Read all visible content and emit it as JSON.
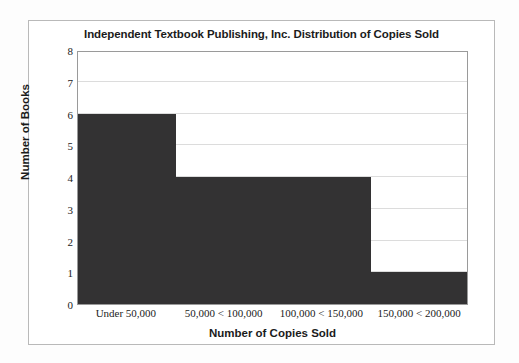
{
  "figure": {
    "background_color": "#ffffff",
    "frame_color": "#b9b9b9",
    "plot_border_color": "#9a9a9a"
  },
  "chart_data": {
    "type": "bar",
    "title": "Independent Textbook Publishing, Inc. Distribution of Copies Sold",
    "xlabel": "Number of Copies Sold",
    "ylabel": "Number of Books",
    "categories": [
      "Under 50,000",
      "50,000 < 100,000",
      "100,000 < 150,000",
      "150,000 < 200,000"
    ],
    "values": [
      6,
      4,
      4,
      1
    ],
    "ylim": [
      0,
      8
    ],
    "ytick_labels": [
      "0",
      "1",
      "2",
      "3",
      "4",
      "5",
      "6",
      "7",
      "8"
    ],
    "ytick_values": [
      0,
      1,
      2,
      3,
      4,
      5,
      6,
      7,
      8
    ],
    "grid": true,
    "legend": null,
    "bar_color": "#333233",
    "bar_gap": 0,
    "style": "histogram"
  }
}
